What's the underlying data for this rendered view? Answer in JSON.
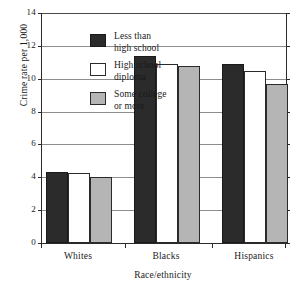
{
  "chart_data": {
    "type": "bar",
    "title": "",
    "xlabel": "Race/ethnicity",
    "ylabel": "Crime rate per 1,000",
    "categories": [
      "Whites",
      "Blacks",
      "Hispanics"
    ],
    "series": [
      {
        "name": "Less than high school",
        "values": [
          4.3,
          11.4,
          10.9
        ],
        "color": "#2b2b2b"
      },
      {
        "name": "High school diploma",
        "values": [
          4.25,
          10.9,
          10.5
        ],
        "color": "#ffffff"
      },
      {
        "name": "Some college or more",
        "values": [
          4.0,
          10.8,
          9.7
        ],
        "color": "#b5b5b5"
      }
    ],
    "ylim": [
      0,
      14
    ],
    "yticks": [
      0,
      2,
      4,
      6,
      8,
      10,
      12,
      14
    ],
    "ytick_labels": [
      "0",
      "2",
      "4",
      "6",
      "8",
      "10",
      "12",
      "14"
    ],
    "grid": true,
    "grid_axis": "y",
    "legend_position": "upper-left-inside"
  },
  "legend": {
    "items": [
      {
        "label": "Less than\nhigh school",
        "swatch": "dark-swatch"
      },
      {
        "label": "High school\ndiploma",
        "swatch": "white-swatch"
      },
      {
        "label": "Some college\nor more",
        "swatch": "gray-swatch"
      }
    ]
  }
}
